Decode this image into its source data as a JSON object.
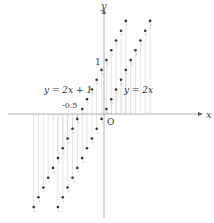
{
  "figure": {
    "type": "function-graph",
    "axes": {
      "x_label": "x",
      "y_label": "y",
      "origin_label": "O",
      "tick_labels": [
        {
          "axis": "y",
          "value": 1,
          "text": "1"
        },
        {
          "axis": "x",
          "value": -0.5,
          "text": "-0.5"
        }
      ]
    },
    "lines": [
      {
        "name": "line-2x-plus-1",
        "label": "y = 2x + 1",
        "slope": 2,
        "intercept": 1
      },
      {
        "name": "line-2x",
        "label": "y = 2x",
        "slope": 2,
        "intercept": 0
      }
    ],
    "style": {
      "axis_color": "#999999",
      "dot_color": "#333333",
      "hatch_color": "#cccccc",
      "text_color": "#333333"
    }
  },
  "chart_data": {
    "type": "scatter",
    "title": "",
    "xlabel": "x",
    "ylabel": "y",
    "series": [
      {
        "name": "y = 2x + 1",
        "x_range": [
          -1.45,
          0.5
        ],
        "step": 0.1,
        "formula": "2x+1"
      },
      {
        "name": "y = 2x",
        "x_range": [
          -0.95,
          1.0
        ],
        "step": 0.1,
        "formula": "2x"
      }
    ],
    "annotations": [
      "1",
      "-0.5",
      "O"
    ],
    "grid": false
  }
}
